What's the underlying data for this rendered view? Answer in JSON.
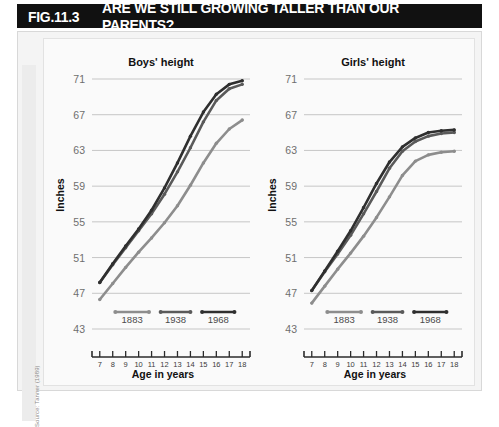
{
  "header": {
    "figure_number": "FIG.11.3",
    "headline": "ARE WE STILL GROWING TALLER THAN OUR PARENTS?"
  },
  "source": "Source: Tanner (1989)",
  "chart_data": [
    {
      "type": "line",
      "title": "Boys' height",
      "xlabel": "Age in years",
      "ylabel": "Inches",
      "xlim": [
        6.4,
        18.6
      ],
      "ylim": [
        43,
        71
      ],
      "yticks": [
        43,
        47,
        51,
        55,
        59,
        63,
        67,
        71
      ],
      "xticks": [
        7,
        8,
        9,
        10,
        11,
        12,
        13,
        14,
        15,
        16,
        17,
        18
      ],
      "grid": true,
      "legend_position": "bottom-inside",
      "series": [
        {
          "name": "1883",
          "color": "#8d8d8d",
          "x": [
            7,
            8,
            9,
            10,
            11,
            12,
            13,
            14,
            15,
            16,
            17,
            18
          ],
          "values": [
            46.3,
            48.1,
            49.9,
            51.6,
            53.2,
            54.9,
            56.8,
            59.1,
            61.6,
            63.8,
            65.4,
            66.4
          ]
        },
        {
          "name": "1938",
          "color": "#5a5a5a",
          "x": [
            7,
            8,
            9,
            10,
            11,
            12,
            13,
            14,
            15,
            16,
            17,
            18
          ],
          "values": [
            48.2,
            50.2,
            52.1,
            54.0,
            55.9,
            58.1,
            60.6,
            63.3,
            66.2,
            68.6,
            69.9,
            70.4
          ]
        },
        {
          "name": "1968",
          "color": "#2f2f2f",
          "x": [
            7,
            8,
            9,
            10,
            11,
            12,
            13,
            14,
            15,
            16,
            17,
            18
          ],
          "values": [
            48.2,
            50.3,
            52.3,
            54.2,
            56.3,
            58.8,
            61.6,
            64.6,
            67.3,
            69.3,
            70.4,
            70.8
          ]
        }
      ]
    },
    {
      "type": "line",
      "title": "Girls' height",
      "xlabel": "Age in years",
      "ylabel": "Inches",
      "xlim": [
        6.4,
        18.6
      ],
      "ylim": [
        43,
        71
      ],
      "yticks": [
        43,
        47,
        51,
        55,
        59,
        63,
        67,
        71
      ],
      "xticks": [
        7,
        8,
        9,
        10,
        11,
        12,
        13,
        14,
        15,
        16,
        17,
        18
      ],
      "grid": true,
      "legend_position": "bottom-inside",
      "series": [
        {
          "name": "1883",
          "color": "#8d8d8d",
          "x": [
            7,
            8,
            9,
            10,
            11,
            12,
            13,
            14,
            15,
            16,
            17,
            18
          ],
          "values": [
            45.9,
            47.8,
            49.7,
            51.5,
            53.4,
            55.5,
            57.8,
            60.2,
            61.8,
            62.5,
            62.8,
            62.9
          ]
        },
        {
          "name": "1938",
          "color": "#5a5a5a",
          "x": [
            7,
            8,
            9,
            10,
            11,
            12,
            13,
            14,
            15,
            16,
            17,
            18
          ],
          "values": [
            47.3,
            49.4,
            51.4,
            53.5,
            55.9,
            58.4,
            61.0,
            62.9,
            64.0,
            64.6,
            64.9,
            65.0
          ]
        },
        {
          "name": "1968",
          "color": "#2f2f2f",
          "x": [
            7,
            8,
            9,
            10,
            11,
            12,
            13,
            14,
            15,
            16,
            17,
            18
          ],
          "values": [
            47.3,
            49.5,
            51.7,
            54.0,
            56.6,
            59.3,
            61.7,
            63.4,
            64.4,
            65.0,
            65.2,
            65.3
          ]
        }
      ]
    }
  ]
}
